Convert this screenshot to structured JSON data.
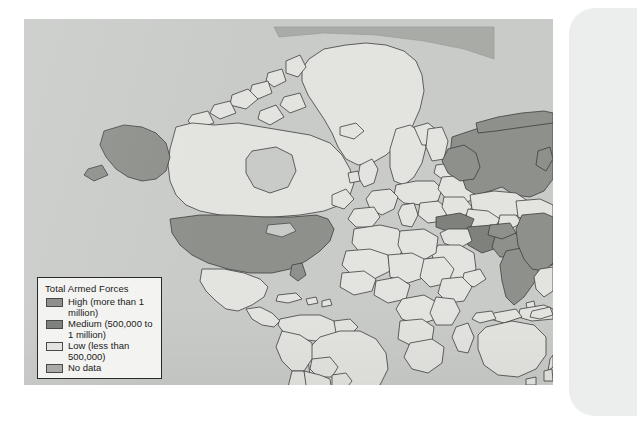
{
  "figure": {
    "kind": "world-choropleth-map",
    "source_caption": "Human Development Report (2008), pp. 318-321."
  },
  "legend": {
    "title": "Total Armed Forces",
    "items": [
      {
        "key": "high",
        "swatch": "high-swatch",
        "label": "High (more than 1 million)",
        "color": "#8e908c"
      },
      {
        "key": "medium",
        "swatch": "medium-swatch",
        "label": "Medium (500,000 to 1 million)",
        "color": "#7f817d"
      },
      {
        "key": "low",
        "swatch": "low-swatch",
        "label": "Low (less than 500,000)",
        "color": "#e3e4e0"
      },
      {
        "key": "nodata",
        "swatch": "nodata-swatch",
        "label": "No data",
        "color": "#a9aba7"
      }
    ]
  },
  "colors": {
    "ocean": "#c9cbc9",
    "high": "#8e908c",
    "medium": "#7f817d",
    "low": "#e3e4e0",
    "no_data": "#a9aba7",
    "border": "#3d3f3d",
    "page": "#eceded",
    "paper": "#ffffff"
  }
}
